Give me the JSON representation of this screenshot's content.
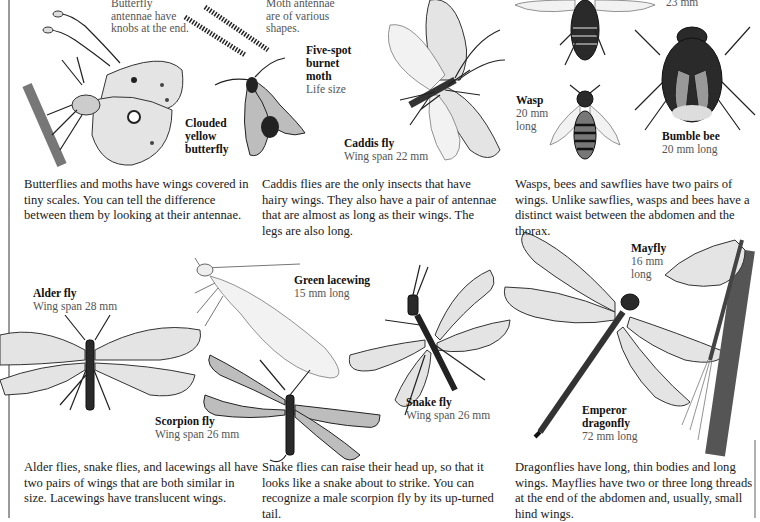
{
  "notes": {
    "butterfly_antennae": "Butterfly antennae have knobs at the end.",
    "moth_antennae": "Moth antennae are of various shapes."
  },
  "labels": {
    "clouded_yellow": {
      "name": "Clouded yellow butterfly",
      "line1": "Clouded",
      "line2": "yellow",
      "line3": "butterfly"
    },
    "burnet_moth": {
      "line1": "Five-spot",
      "line2": "burnet",
      "line3": "moth",
      "detail": "Life size"
    },
    "caddis_fly": {
      "name": "Caddis fly",
      "detail": "Wing span 22 mm"
    },
    "sawfly": {
      "detail": "23 mm"
    },
    "wasp": {
      "name": "Wasp",
      "detail1": "20 mm",
      "detail2": "long"
    },
    "bumble_bee": {
      "name": "Bumble bee",
      "detail": "20 mm long"
    },
    "alder_fly": {
      "name": "Alder fly",
      "detail": "Wing span 28 mm"
    },
    "green_lacewing": {
      "name": "Green lacewing",
      "detail": "15 mm long"
    },
    "scorpion_fly": {
      "name": "Scorpion fly",
      "detail": "Wing span 26 mm"
    },
    "snake_fly": {
      "name": "Snake fly",
      "detail": "Wing span 26 mm"
    },
    "mayfly": {
      "name": "Mayfly",
      "detail1": "16 mm",
      "detail2": "long"
    },
    "emperor_dragonfly": {
      "line1": "Emperor",
      "line2": "dragonfly",
      "detail": "72 mm long"
    }
  },
  "paragraphs": {
    "butterflies_moths": "Butterflies and moths have wings covered in tiny scales. You can tell the difference between them by looking at their antennae.",
    "caddis": "Caddis flies are the only insects that have hairy wings. They also have a pair of antennae that are almost as long as their wings. The legs are also long.",
    "wasps_bees": "Wasps, bees and sawflies have two pairs of wings. Unlike sawflies, wasps and bees have a distinct waist between the abdomen and the thorax.",
    "alder_snake_lace": "Alder flies, snake flies, and lacewings all have two pairs of wings that are both similar in size. Lacewings have translucent wings.",
    "snake_scorpion": "Snake flies can raise their head up, so that it looks like a snake about to strike. You can recognize a male scorpion fly by its up-turned tail.",
    "dragon_may": "Dragonflies have long, thin bodies and long wings. Mayflies have two or three long threads at the end of the abdomen and, usually, small hind wings."
  },
  "illustrations": [
    "butterfly-antennae-icon",
    "moth-antennae-icon",
    "clouded-yellow-butterfly-icon",
    "burnet-moth-icon",
    "caddis-fly-icon",
    "sawfly-icon",
    "wasp-icon",
    "bumble-bee-icon",
    "alder-fly-icon",
    "green-lacewing-icon",
    "scorpion-fly-icon",
    "snake-fly-icon",
    "emperor-dragonfly-icon",
    "mayfly-icon"
  ]
}
